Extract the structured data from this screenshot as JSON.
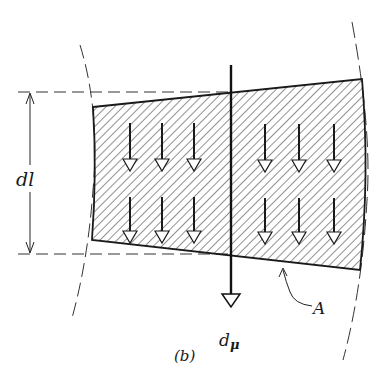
{
  "figure": {
    "caption": "(b)",
    "labels": {
      "length_element": "dl",
      "moment_symbol": "d",
      "moment_subscript": "μ",
      "area": "A"
    },
    "colors": {
      "ink": "#1a1a1a",
      "hatch": "#555555",
      "background": "#ffffff"
    },
    "arrows": {
      "rows": 2,
      "per_row": 6,
      "direction": "down"
    }
  }
}
